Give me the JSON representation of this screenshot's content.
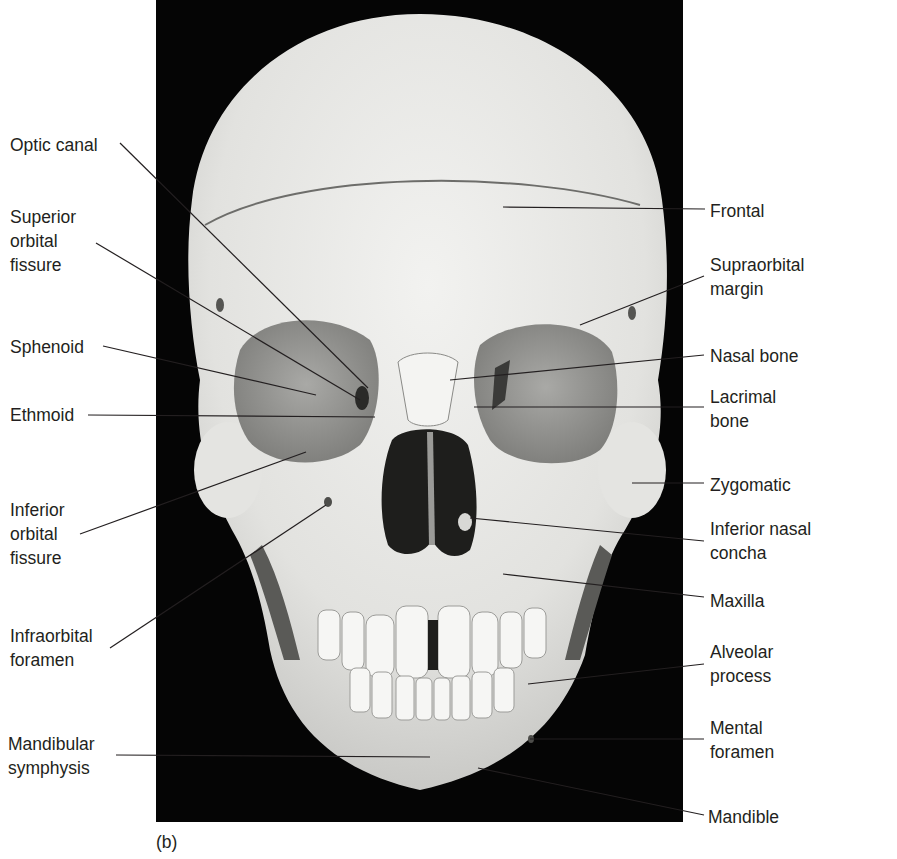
{
  "figure": {
    "panel_letter": "(b)",
    "view": "Anterior view of human skull",
    "background_color": "#050505",
    "bone_color": "#e6e6e4"
  },
  "labels_left": [
    {
      "id": "optic-canal",
      "text": "Optic canal",
      "x": 10,
      "y": 133
    },
    {
      "id": "superior-orbital-fissure",
      "text": "Superior\norbital\nfissure",
      "x": 10,
      "y": 205
    },
    {
      "id": "sphenoid",
      "text": "Sphenoid",
      "x": 10,
      "y": 335
    },
    {
      "id": "ethmoid",
      "text": "Ethmoid",
      "x": 10,
      "y": 403
    },
    {
      "id": "inferior-orbital-fissure",
      "text": "Inferior\norbital\nfissure",
      "x": 10,
      "y": 498
    },
    {
      "id": "infraorbital-foramen",
      "text": "Infraorbital\nforamen",
      "x": 10,
      "y": 624
    },
    {
      "id": "mandibular-symphysis",
      "text": "Mandibular\nsymphysis",
      "x": 8,
      "y": 732
    }
  ],
  "labels_right": [
    {
      "id": "frontal",
      "text": "Frontal",
      "x": 710,
      "y": 199
    },
    {
      "id": "supraorbital-margin",
      "text": "Supraorbital\nmargin",
      "x": 710,
      "y": 253
    },
    {
      "id": "nasal-bone",
      "text": "Nasal bone",
      "x": 710,
      "y": 344
    },
    {
      "id": "lacrimal-bone",
      "text": "Lacrimal\nbone",
      "x": 710,
      "y": 385
    },
    {
      "id": "zygomatic",
      "text": "Zygomatic",
      "x": 710,
      "y": 473
    },
    {
      "id": "inferior-nasal-concha",
      "text": "Inferior nasal\nconcha",
      "x": 710,
      "y": 517
    },
    {
      "id": "maxilla",
      "text": "Maxilla",
      "x": 710,
      "y": 589
    },
    {
      "id": "alveolar-process",
      "text": "Alveolar\nprocess",
      "x": 710,
      "y": 640
    },
    {
      "id": "mental-foramen",
      "text": "Mental\nforamen",
      "x": 710,
      "y": 716
    },
    {
      "id": "mandible",
      "text": "Mandible",
      "x": 708,
      "y": 805
    }
  ],
  "leader_lines": [
    {
      "id": "optic-canal",
      "x1": 120,
      "y1": 143,
      "x2": 368,
      "y2": 388
    },
    {
      "id": "superior-orbital-fissure",
      "x1": 96,
      "y1": 243,
      "x2": 360,
      "y2": 400
    },
    {
      "id": "sphenoid",
      "x1": 103,
      "y1": 346,
      "x2": 316,
      "y2": 395
    },
    {
      "id": "ethmoid",
      "x1": 88,
      "y1": 415,
      "x2": 375,
      "y2": 417
    },
    {
      "id": "inferior-orbital-fissure",
      "x1": 80,
      "y1": 534,
      "x2": 306,
      "y2": 452
    },
    {
      "id": "infraorbital-foramen",
      "x1": 110,
      "y1": 648,
      "x2": 326,
      "y2": 505
    },
    {
      "id": "mandibular-symphysis",
      "x1": 116,
      "y1": 755,
      "x2": 430,
      "y2": 757
    },
    {
      "id": "frontal",
      "x1": 503,
      "y1": 207,
      "x2": 705,
      "y2": 209
    },
    {
      "id": "supraorbital-margin",
      "x1": 580,
      "y1": 325,
      "x2": 704,
      "y2": 276
    },
    {
      "id": "nasal-bone",
      "x1": 450,
      "y1": 380,
      "x2": 704,
      "y2": 355
    },
    {
      "id": "lacrimal-bone",
      "x1": 474,
      "y1": 407,
      "x2": 704,
      "y2": 407
    },
    {
      "id": "zygomatic",
      "x1": 632,
      "y1": 483,
      "x2": 704,
      "y2": 483
    },
    {
      "id": "inferior-nasal-concha",
      "x1": 470,
      "y1": 518,
      "x2": 704,
      "y2": 541
    },
    {
      "id": "maxilla",
      "x1": 503,
      "y1": 574,
      "x2": 704,
      "y2": 597
    },
    {
      "id": "alveolar-process",
      "x1": 528,
      "y1": 684,
      "x2": 704,
      "y2": 664
    },
    {
      "id": "mental-foramen",
      "x1": 530,
      "y1": 739,
      "x2": 704,
      "y2": 739
    },
    {
      "id": "mandible",
      "x1": 478,
      "y1": 768,
      "x2": 704,
      "y2": 815
    }
  ]
}
